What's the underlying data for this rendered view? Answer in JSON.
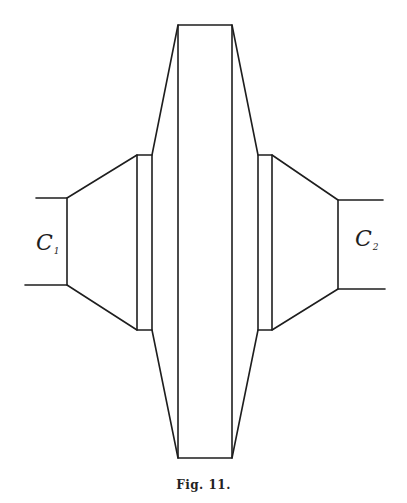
{
  "figure": {
    "caption": "Fig. 11.",
    "labels": {
      "left": {
        "main": "C",
        "sub": "1"
      },
      "right": {
        "main": "C",
        "sub": "2"
      }
    },
    "stroke_color": "#1e1e1e",
    "background": "#ffffff"
  }
}
